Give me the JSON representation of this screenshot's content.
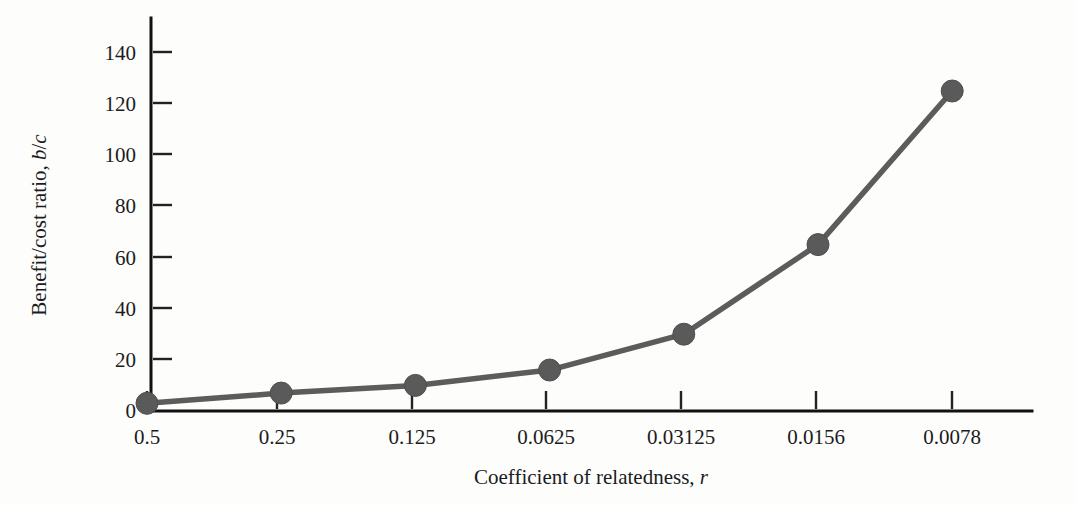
{
  "chart_data": {
    "type": "line",
    "title": "",
    "subtitle": "",
    "xlabel": "Coefficient of relatedness, r",
    "xlabel_plain": "Coefficient of relatedness,",
    "xlabel_italic": "r",
    "ylabel": "Benefit/cost ratio, b/c",
    "ylabel_plain_1": "Benefit/cost ratio,",
    "ylabel_italic_1": "b",
    "ylabel_plain_2": "/",
    "ylabel_italic_2": "c",
    "categories": [
      "0.5",
      "0.25",
      "0.125",
      "0.0625",
      "0.03125",
      "0.0156",
      "0.0078"
    ],
    "x_numeric": [
      0.5,
      0.25,
      0.125,
      0.0625,
      0.03125,
      0.0156,
      0.0078
    ],
    "values": [
      3,
      7,
      10,
      16,
      30,
      65,
      125
    ],
    "xtick_labels": [
      "0.5",
      "0.25",
      "0.125",
      "0.0625",
      "0.03125",
      "0.0156",
      "0.0078"
    ],
    "ytick_labels": [
      "0",
      "20",
      "40",
      "60",
      "80",
      "100",
      "120",
      "140"
    ],
    "ytick_values": [
      0,
      20,
      40,
      60,
      80,
      100,
      120,
      140
    ],
    "ylim": [
      0,
      150
    ],
    "grid": false,
    "legend": false,
    "legend_position": "none",
    "marker": "circle",
    "series_name": "Benefit/cost ratio",
    "colors": {
      "line": "#5c5c5c",
      "marker": "#5a5a5a",
      "axis": "#111111",
      "text": "#1c1c1c",
      "background": "#fdfdfc"
    }
  }
}
